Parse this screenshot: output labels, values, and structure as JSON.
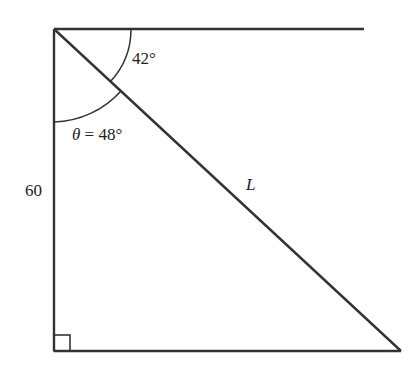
{
  "diagram": {
    "type": "right-triangle",
    "labels": {
      "top_angle": "42°",
      "theta_symbol": "θ",
      "theta_eq": " = 48°",
      "side_vertical": "60",
      "hypotenuse": "L"
    },
    "values": {
      "angle_from_horizontal_deg": 42,
      "theta_deg": 48,
      "vertical_side": 60
    },
    "colors": {
      "stroke": "#333333",
      "text": "#222222"
    }
  }
}
